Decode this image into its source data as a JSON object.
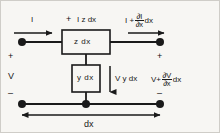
{
  "figure": {
    "type": "circuit-diagram",
    "background_color": "#f7f6f3",
    "ink_color": "#1a1a1a"
  },
  "labels": {
    "current_in": "I",
    "series_drop_sign": "+",
    "series_drop": "I z dx",
    "current_out_base": "I +",
    "current_out_num": "∂I",
    "current_out_den": "∂x",
    "current_out_tail": "dx",
    "series_box": "z  dx",
    "shunt_box": "y  dx",
    "shunt_current": "V y dx",
    "voltage_in": "V",
    "voltage_out_base": "V+",
    "voltage_out_num": "∂V",
    "voltage_out_den": "∂x",
    "voltage_out_tail": "dx",
    "length_label": "dx",
    "plus_left": "+",
    "minus_left": "–",
    "plus_right": "+",
    "minus_right": "–"
  },
  "nodes": {
    "top_left_terminal": "top-left-terminal-node",
    "top_right_terminal": "top-right-terminal-node",
    "bottom_left_terminal": "bottom-left-terminal-node",
    "bottom_mid_terminal": "bottom-middle-junction-node",
    "bottom_right_terminal": "bottom-right-terminal-node"
  }
}
